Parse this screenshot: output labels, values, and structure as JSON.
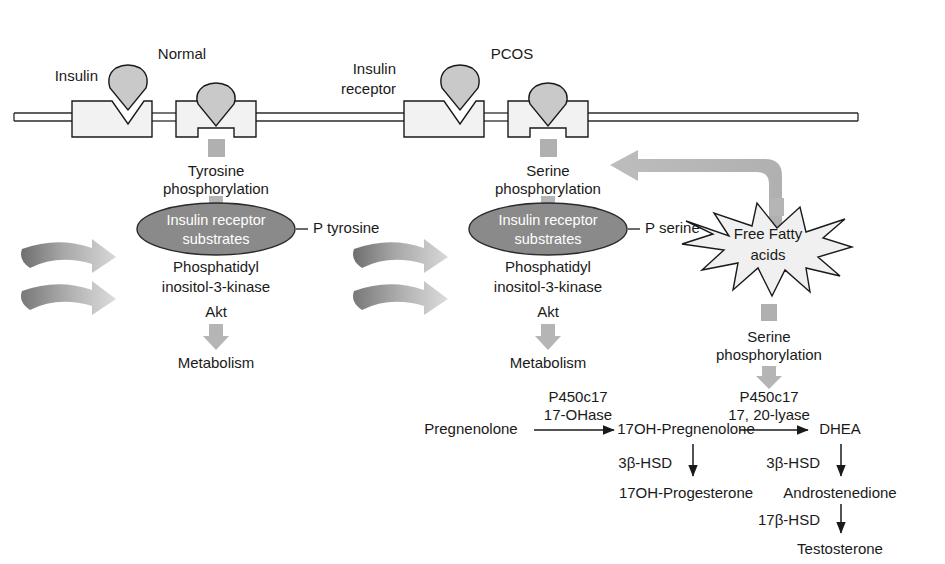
{
  "figure": {
    "colors": {
      "background": "#ffffff",
      "outline": "#1a1a1a",
      "receptor_fill": "#f2f2f2",
      "insulin_fill": "#c9c9c9",
      "oval_fill": "#8a8a8a",
      "oval_text": "#ffffff",
      "block_arrow": "#b5b5b5",
      "spiral_dark": "#6e6e6e",
      "spiral_light": "#d2d2d2",
      "starburst_fill": "#f0f0f0",
      "phospho_square": "#b0b0b0",
      "text": "#1a1a1a"
    }
  },
  "panels": {
    "normal": {
      "heading": "Normal",
      "insulin_label": "Insulin",
      "phosphorylation": "Tyrosine\nphosphorylation",
      "phosphorylation_line1": "Tyrosine",
      "phosphorylation_line2": "phosphorylation",
      "substrate_oval_line1": "Insulin receptor",
      "substrate_oval_line2": "substrates",
      "p_label": "P tyrosine",
      "kinase_line1": "Phosphatidyl",
      "kinase_line2": "inositol-3-kinase",
      "akt": "Akt",
      "outcome": "Metabolism"
    },
    "pcos": {
      "heading": "PCOS",
      "receptor_label_line1": "Insulin",
      "receptor_label_line2": "receptor",
      "phosphorylation_line1": "Serine",
      "phosphorylation_line2": "phosphorylation",
      "substrate_oval_line1": "Insulin receptor",
      "substrate_oval_line2": "substrates",
      "p_label": "P serine",
      "kinase_line1": "Phosphatidyl",
      "kinase_line2": "inositol-3-kinase",
      "akt": "Akt",
      "outcome": "Metabolism"
    },
    "ffa": {
      "burst_line1": "Free Fatty",
      "burst_line2": "acids",
      "phosphorylation_line1": "Serine",
      "phosphorylation_line2": "phosphorylation"
    }
  },
  "steroidogenesis": {
    "enzymes": {
      "ohase_line1": "P450c17",
      "ohase_line2": "17-OHase",
      "lyase_line1": "P450c17",
      "lyase_line2": "17, 20-lyase",
      "hsd3b_left": "3β-HSD",
      "hsd3b_right": "3β-HSD",
      "hsd17b": "17β-HSD"
    },
    "metabolites": {
      "pregnenolone": "Pregnenolone",
      "oh_pregnenolone": "17OH-Pregnenolone",
      "oh_progesterone": "17OH-Progesterone",
      "dhea": "DHEA",
      "androstenedione": "Androstenedione",
      "testosterone": "Testosterone"
    }
  }
}
